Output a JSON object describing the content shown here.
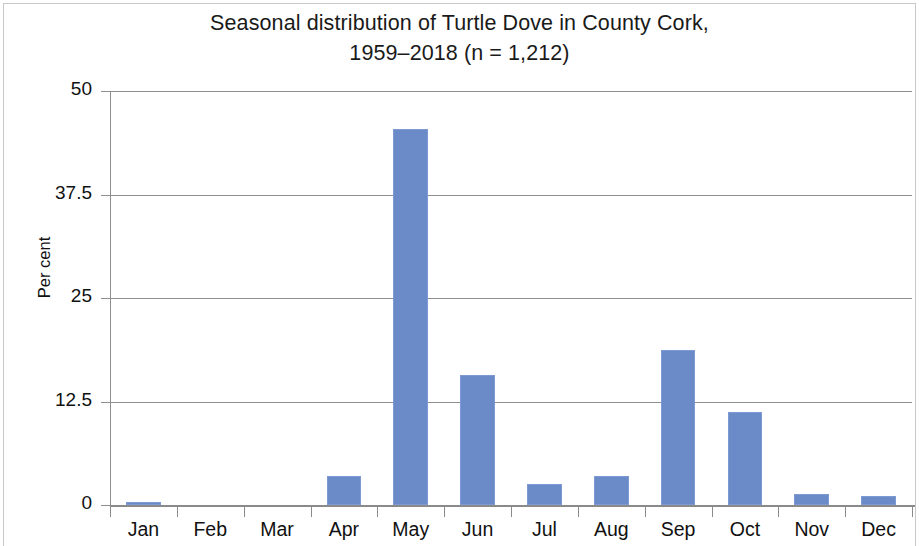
{
  "chart_data": {
    "type": "bar",
    "title_line1": "Seasonal distribution of Turtle Dove in County Cork,",
    "title_line2": "1959–2018 (n = 1,212)",
    "xlabel": "",
    "ylabel": "Per cent",
    "categories": [
      "Jan",
      "Feb",
      "Mar",
      "Apr",
      "May",
      "Jun",
      "Jul",
      "Aug",
      "Sep",
      "Oct",
      "Nov",
      "Dec"
    ],
    "values": [
      0.4,
      0,
      0,
      3.5,
      45.4,
      15.7,
      2.5,
      3.5,
      18.7,
      11.2,
      1.3,
      1.1
    ],
    "ylim": [
      0,
      50
    ],
    "yticks": [
      0,
      12.5,
      25,
      37.5,
      50
    ],
    "ytick_labels": [
      "0",
      "12.5",
      "25",
      "37.5",
      "50"
    ],
    "grid": "horizontal",
    "legend": "none",
    "bar_color": "#6b8ac8",
    "grid_color": "#8f8f8f",
    "axis_color": "#8a8a8a",
    "text_color": "#111111"
  }
}
